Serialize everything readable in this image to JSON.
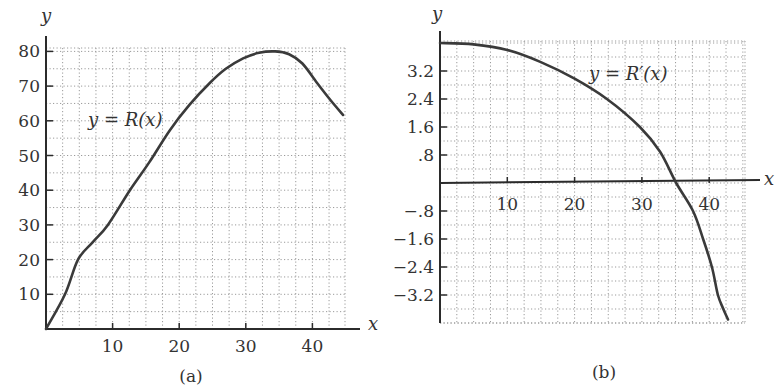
{
  "colors": {
    "axis": "#2b2b2b",
    "curve": "#3a3a3a",
    "grid": "#9a9a9a",
    "text": "#333333",
    "background": "#ffffff"
  },
  "chart_data": [
    {
      "id": "a",
      "type": "line",
      "caption": "(a)",
      "xlabel": "x",
      "ylabel": "y",
      "curve_label": "y = R(x)",
      "curve_label_parts": {
        "lhs": "y",
        "eq": " = ",
        "fn": "R",
        "arg": "(x)"
      },
      "xlim": [
        0,
        45
      ],
      "ylim": [
        0,
        80
      ],
      "grid": true,
      "grid_x_step": 2.5,
      "grid_y_step": 5,
      "xticks": [
        10,
        20,
        30,
        40
      ],
      "xtick_labels": [
        "10",
        "20",
        "30",
        "40"
      ],
      "yticks": [
        10,
        20,
        30,
        40,
        50,
        60,
        70,
        80
      ],
      "ytick_labels": [
        "10",
        "20",
        "30",
        "40",
        "50",
        "60",
        "70",
        "80"
      ],
      "series": [
        {
          "name": "R(x)",
          "x": [
            0,
            2.85,
            4.8,
            7.0,
            9.3,
            12.6,
            15.5,
            18.6,
            21.5,
            24.6,
            27.0,
            29.6,
            32.0,
            34.4,
            36.5,
            38.5,
            40.7,
            42.7,
            44.6
          ],
          "y": [
            0,
            10,
            20,
            25,
            30,
            40,
            48,
            57.3,
            64.5,
            70.9,
            75,
            78,
            79.6,
            80,
            79.2,
            76.5,
            70.9,
            66,
            61.7
          ]
        }
      ]
    },
    {
      "id": "b",
      "type": "line",
      "caption": "(b)",
      "xlabel": "x",
      "ylabel": "y",
      "curve_label": "y = R′(x)",
      "curve_label_parts": {
        "lhs": "y",
        "eq": " = ",
        "fn": "R′",
        "arg": "(x)"
      },
      "xlim": [
        0,
        45
      ],
      "ylim": [
        -4.0,
        4.0
      ],
      "grid": true,
      "grid_x_step": 2.5,
      "grid_y_step": 0.4,
      "xticks": [
        10,
        20,
        30,
        40
      ],
      "xtick_labels": [
        "10",
        "20",
        "30",
        "40"
      ],
      "yticks": [
        3.2,
        2.4,
        1.6,
        0.8,
        -0.8,
        -1.6,
        -2.4,
        -3.2
      ],
      "ytick_labels": [
        "3.2",
        "2.4",
        "1.6",
        ".8",
        "−.8",
        "−1.6",
        "−2.4",
        "−3.2"
      ],
      "series": [
        {
          "name": "R'(x)",
          "x": [
            0,
            5,
            10,
            14.9,
            20,
            24.8,
            29.7,
            32.7,
            35.1,
            37.6,
            39.1,
            40.4,
            41.3,
            42.1,
            42.8
          ],
          "y": [
            4.0,
            3.96,
            3.8,
            3.46,
            2.98,
            2.4,
            1.6,
            0.89,
            0,
            -0.8,
            -1.6,
            -2.4,
            -3.2,
            -3.6,
            -3.9
          ]
        }
      ]
    }
  ]
}
